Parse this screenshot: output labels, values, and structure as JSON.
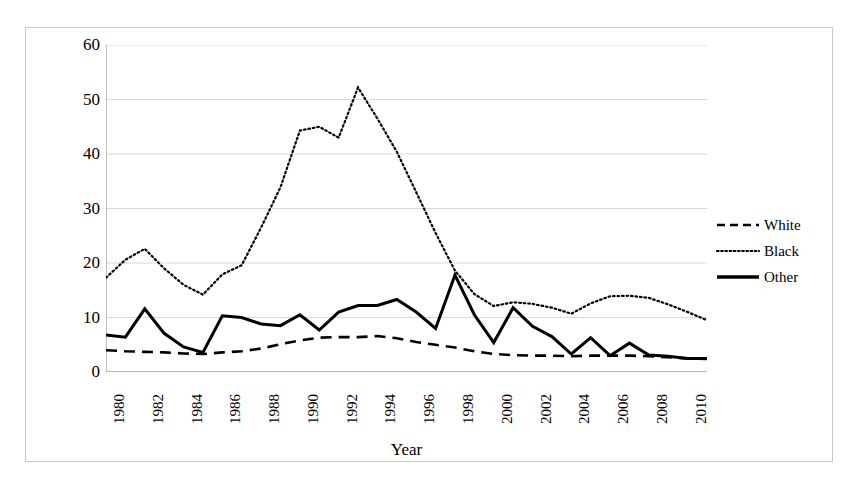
{
  "chart_data": {
    "type": "line",
    "title": "",
    "xlabel": "Year",
    "ylabel": "Arrest Rate (per 100,000)",
    "xlim": [
      1980,
      2011
    ],
    "ylim": [
      0,
      60
    ],
    "yticks": [
      0,
      10,
      20,
      30,
      40,
      50,
      60
    ],
    "xticks": [
      1980,
      1982,
      1984,
      1986,
      1988,
      1990,
      1992,
      1994,
      1996,
      1998,
      2000,
      2002,
      2004,
      2006,
      2008,
      2010
    ],
    "xtick_labels": [
      "1980",
      "1982",
      "1984",
      "1986",
      "1988",
      "1990",
      "1992",
      "1994",
      "1996",
      "1998",
      "2000",
      "2002",
      "2004",
      "2006",
      "2008",
      "2010"
    ],
    "ytick_labels": [
      "0",
      "10",
      "20",
      "30",
      "40",
      "50",
      "60"
    ],
    "grid": "horizontal",
    "legend_position": "right",
    "x": [
      1980,
      1981,
      1982,
      1983,
      1984,
      1985,
      1986,
      1987,
      1988,
      1989,
      1990,
      1991,
      1992,
      1993,
      1994,
      1995,
      1996,
      1997,
      1998,
      1999,
      2000,
      2001,
      2002,
      2003,
      2004,
      2005,
      2006,
      2007,
      2008,
      2009,
      2010,
      2011
    ],
    "series": [
      {
        "name": "White",
        "style": "dashed",
        "color": "#000000",
        "values": [
          4.0,
          3.8,
          3.7,
          3.6,
          3.4,
          3.3,
          3.6,
          3.8,
          4.3,
          5.1,
          5.8,
          6.3,
          6.4,
          6.4,
          6.6,
          6.2,
          5.5,
          5.0,
          4.5,
          3.8,
          3.3,
          3.1,
          3.0,
          3.0,
          2.9,
          3.0,
          3.0,
          3.0,
          2.9,
          2.7,
          2.5,
          2.4
        ]
      },
      {
        "name": "Black",
        "style": "dotted",
        "color": "#000000",
        "values": [
          17.3,
          20.6,
          22.6,
          19.0,
          16.0,
          14.2,
          17.9,
          19.6,
          26.5,
          33.9,
          44.3,
          45.0,
          43.0,
          52.2,
          46.5,
          40.4,
          33.0,
          25.5,
          18.6,
          14.3,
          12.1,
          12.8,
          12.5,
          11.8,
          10.7,
          12.6,
          13.9,
          14.0,
          13.6,
          12.4,
          11.0,
          9.5
        ]
      },
      {
        "name": "Other",
        "style": "solid",
        "color": "#000000",
        "values": [
          6.8,
          6.4,
          11.6,
          7.1,
          4.6,
          3.6,
          10.3,
          10.0,
          8.8,
          8.5,
          10.5,
          7.7,
          11.0,
          12.2,
          12.2,
          13.3,
          11.0,
          8.0,
          17.8,
          10.5,
          5.4,
          11.8,
          8.4,
          6.5,
          3.3,
          6.3,
          3.0,
          5.3,
          3.1,
          2.9,
          2.5,
          2.5
        ]
      }
    ]
  },
  "legend": {
    "items": [
      {
        "label": "White",
        "style": "dashed"
      },
      {
        "label": "Black",
        "style": "dotted"
      },
      {
        "label": "Other",
        "style": "solid"
      }
    ]
  },
  "axes": {
    "y_title": "Arrest Rate (per 100,000)",
    "x_title": "Year"
  }
}
